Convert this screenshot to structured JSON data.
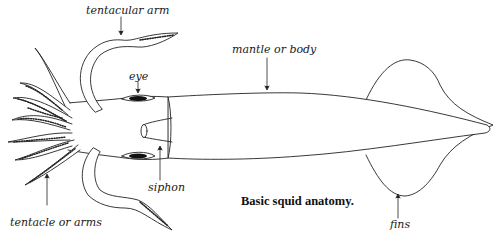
{
  "diagram": {
    "caption": "Basic squid anatomy.",
    "labels": {
      "tentacular_arm": "tentacular arm",
      "eye": "eye",
      "mantle": "mantle or body",
      "siphon": "siphon",
      "tentacle_arms": "tentacle or arms",
      "fins": "fins"
    },
    "colors": {
      "stroke": "#222222",
      "fill": "#ffffff",
      "eye": "#111111"
    }
  }
}
